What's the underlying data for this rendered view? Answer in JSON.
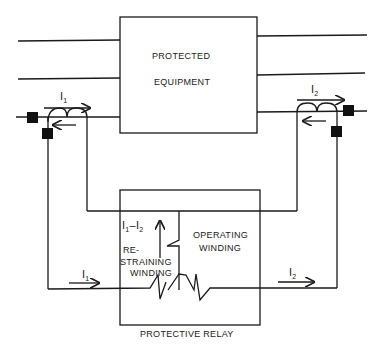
{
  "diagram": {
    "type": "differential-relay-schematic",
    "equipment": {
      "line1": "PROTECTED",
      "line2": "EQUIPMENT"
    },
    "relay": {
      "caption": "PROTECTIVE RELAY",
      "restraining": {
        "line1": "RE-",
        "line2": "STRAINING",
        "line3": "WINDING"
      },
      "operating": {
        "line1": "OPERATING",
        "line2": "WINDING"
      },
      "difference_current": {
        "a": "I",
        "a_sub": "1",
        "dash": "–",
        "b": "I",
        "b_sub": "2"
      }
    },
    "currents": {
      "left_ct": {
        "sym": "I",
        "sub": "1"
      },
      "right_ct": {
        "sym": "I",
        "sub": "2"
      },
      "left_wire": {
        "sym": "I",
        "sub": "1"
      },
      "right_wire": {
        "sym": "I",
        "sub": "2"
      }
    },
    "colors": {
      "line": "#1a1a1a",
      "background": "#ffffff",
      "breaker": "#111111"
    }
  }
}
